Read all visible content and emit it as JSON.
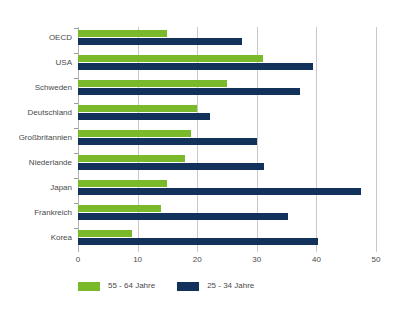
{
  "chart_data": {
    "type": "bar",
    "orientation": "horizontal",
    "title": "",
    "subtitle": "",
    "xlabel": "",
    "ylabel": "",
    "xlim": [
      0,
      50
    ],
    "xticks": [
      "0",
      "10",
      "20",
      "30",
      "40",
      "50"
    ],
    "grid": true,
    "legend_position": "bottom-left",
    "categories": [
      "OECD",
      "USA",
      "Schweden",
      "Deutschland",
      "Großbritannien",
      "Niederlande",
      "Japan",
      "Frankreich",
      "Korea"
    ],
    "series": [
      {
        "name": "55 - 64 Jahre",
        "color": "#7ab929",
        "values": [
          15.0,
          31.0,
          25.0,
          20.0,
          19.0,
          18.0,
          15.0,
          14.0,
          9.0
        ]
      },
      {
        "name": "25 - 34 Jahre",
        "color": "#12315b",
        "values": [
          27.5,
          39.5,
          37.3,
          22.2,
          30.0,
          31.2,
          47.5,
          35.2,
          40.2
        ]
      }
    ]
  },
  "legend": {
    "items": [
      {
        "label": "55 - 64 Jahre",
        "color": "#7ab929"
      },
      {
        "label": "25 - 34 Jahre",
        "color": "#12315b"
      }
    ]
  },
  "colors": {
    "background": "#ffffff",
    "grid": "#c9c9c9",
    "text": "#4a4a4a",
    "series_older": "#7ab929",
    "series_younger": "#12315b"
  }
}
